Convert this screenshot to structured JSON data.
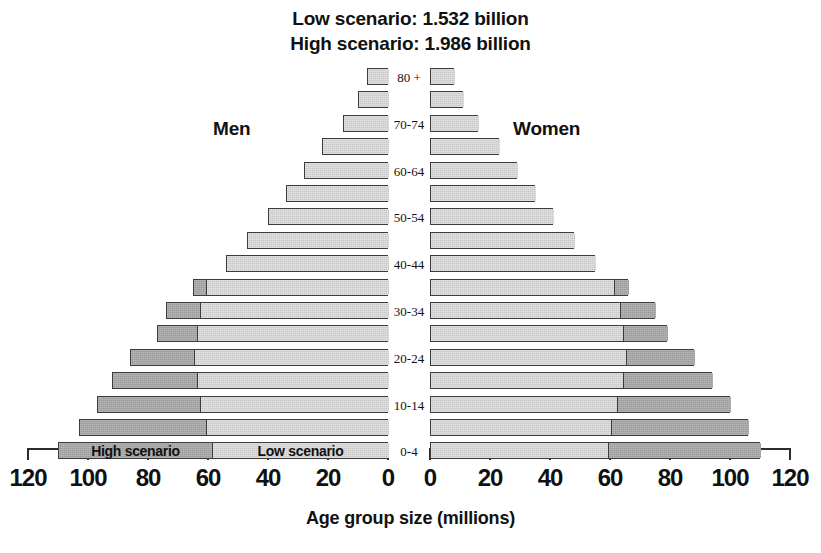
{
  "title": {
    "line1": "Low scenario: 1.532 billion",
    "line2": "High scenario: 1.986 billion"
  },
  "labels": {
    "men": "Men",
    "women": "Women",
    "axis_title": "Age group size (millions)",
    "inbar_high": "High scenario",
    "inbar_low": "Low scenario"
  },
  "colors": {
    "high_scenario": "#9b9b9b",
    "low_scenario": "#c9c9c9",
    "outline": "#3b3b3b",
    "axis": "#2c2c2c",
    "text": "#111111",
    "background": "#ffffff"
  },
  "chart_data": {
    "type": "bar",
    "subtype": "population-pyramid",
    "xlabel": "Age group size (millions)",
    "ylabel": "",
    "xlim": [
      0,
      120
    ],
    "grid": false,
    "legend_position": "in-bar (bottom row)",
    "axis_ticks": [
      120,
      100,
      80,
      60,
      40,
      20,
      0
    ],
    "axis_ticks_right": [
      0,
      20,
      40,
      60,
      80,
      100,
      120
    ],
    "age_groups": [
      "80 +",
      "75-79",
      "70-74",
      "65-69",
      "60-64",
      "55-59",
      "50-54",
      "45-49",
      "40-44",
      "35-39",
      "30-34",
      "25-29",
      "20-24",
      "15-19",
      "10-14",
      "5-9",
      "0-4"
    ],
    "age_labels_shown": [
      "80 +",
      "",
      "70-74",
      "",
      "60-64",
      "",
      "50-54",
      "",
      "40-44",
      "",
      "30-34",
      "",
      "20-24",
      "",
      "10-14",
      "",
      "0-4"
    ],
    "series": [
      {
        "name": "Men low scenario",
        "values": [
          7,
          10,
          15,
          22,
          28,
          34,
          40,
          47,
          54,
          61,
          63,
          64,
          65,
          64,
          63,
          61,
          59
        ]
      },
      {
        "name": "Men high scenario",
        "values": [
          7,
          10,
          15,
          22,
          28,
          34,
          40,
          47,
          54,
          65,
          74,
          77,
          86,
          92,
          97,
          103,
          110
        ]
      },
      {
        "name": "Women low scenario",
        "values": [
          8,
          11,
          16,
          23,
          29,
          35,
          41,
          48,
          55,
          61,
          63,
          64,
          65,
          64,
          62,
          60,
          59
        ]
      },
      {
        "name": "Women high scenario",
        "values": [
          8,
          11,
          16,
          23,
          29,
          35,
          41,
          48,
          55,
          66,
          75,
          79,
          88,
          94,
          100,
          106,
          110
        ]
      }
    ]
  }
}
